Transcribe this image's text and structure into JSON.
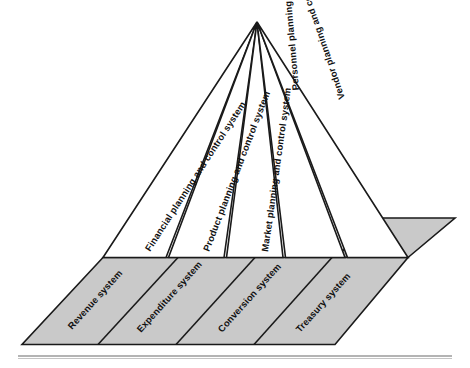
{
  "diagram": {
    "apex_label": "",
    "colors": {
      "face_fill": "#ffffff",
      "base_fill": "#c9c9c9",
      "outline": "#1a1a1a",
      "rule": "#9b9b9b",
      "text": "#111111"
    },
    "pyramid_faces": [
      {
        "id": "financial",
        "label": "Financial planning and control system",
        "orientation": "upright"
      },
      {
        "id": "product",
        "label": "Product planning and control system",
        "orientation": "upright"
      },
      {
        "id": "market",
        "label": "Market planning and control system",
        "orientation": "upright"
      },
      {
        "id": "personnel",
        "label": "Personnel planning and control system",
        "orientation": "mirrored"
      },
      {
        "id": "vendor",
        "label": "Vendor planning and control system",
        "orientation": "mirrored"
      }
    ],
    "base_segments": [
      {
        "id": "revenue",
        "label": "Revenue system"
      },
      {
        "id": "expenditure",
        "label": "Expenditure system"
      },
      {
        "id": "conversion",
        "label": "Conversion system"
      },
      {
        "id": "treasury",
        "label": "Treasury system"
      }
    ]
  }
}
